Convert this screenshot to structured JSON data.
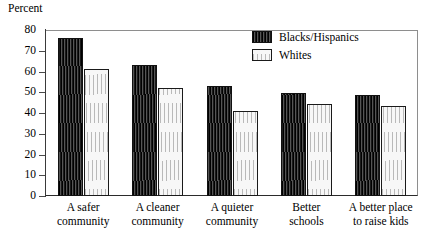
{
  "chart_data": {
    "type": "bar",
    "title": "",
    "ylabel": "Percent",
    "xlabel": "",
    "ylim": [
      0,
      80
    ],
    "yticks": [
      0,
      10,
      20,
      30,
      40,
      50,
      60,
      70,
      80
    ],
    "ytick_labels": [
      "0",
      "10",
      "20",
      "30",
      "40",
      "50",
      "60",
      "70",
      "80"
    ],
    "grid": false,
    "legend_position": "top-right",
    "categories": [
      "A safer community",
      "A cleaner community",
      "A quieter community",
      "Better schools",
      "A better place to raise kids"
    ],
    "category_lines": [
      [
        "A safer",
        "community"
      ],
      [
        "A cleaner",
        "community"
      ],
      [
        "A quieter",
        "community"
      ],
      [
        "Better",
        "schools"
      ],
      [
        "A better place",
        "to raise kids"
      ]
    ],
    "series": [
      {
        "name": "Blacks/Hispanics",
        "values": [
          76,
          63,
          53,
          49.5,
          48.5
        ],
        "color": "#2b2b2b",
        "pattern": "dense-vertical-hatch"
      },
      {
        "name": "Whites",
        "values": [
          61,
          52,
          41,
          44.5,
          43.5
        ],
        "color": "#f2f2f2",
        "pattern": "sparse-vertical-hatch"
      }
    ]
  },
  "legend": {
    "entries": [
      {
        "label": "Blacks/Hispanics"
      },
      {
        "label": "Whites"
      }
    ]
  }
}
